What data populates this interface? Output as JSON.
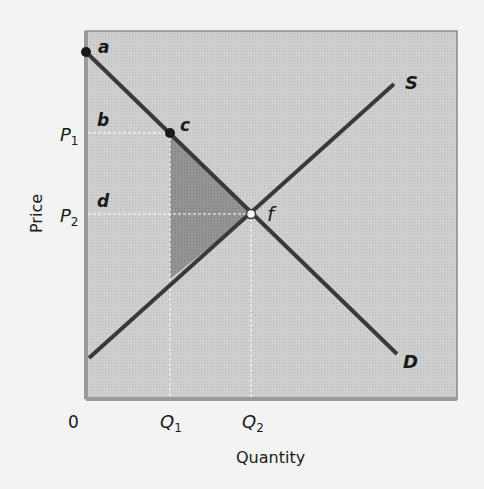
{
  "diagram": {
    "axes": {
      "x_label": "Quantity",
      "y_label": "Price",
      "origin_label": "0",
      "x_ticks": [
        {
          "label": "Q",
          "sub": "1"
        },
        {
          "label": "Q",
          "sub": "2"
        }
      ],
      "y_ticks": [
        {
          "label": "P",
          "sub": "1"
        },
        {
          "label": "P",
          "sub": "2"
        }
      ]
    },
    "curves": {
      "supply_label": "S",
      "demand_label": "D"
    },
    "points": {
      "a": "a",
      "b": "b",
      "c": "c",
      "d": "d",
      "f": "f"
    },
    "colors": {
      "plot_background": "#c9c9c9",
      "curve": "#3a3a3a",
      "shaded_region": "#8e8e8e",
      "guide_lines": "#ffffff",
      "page_background": "#f3f3f3"
    }
  }
}
